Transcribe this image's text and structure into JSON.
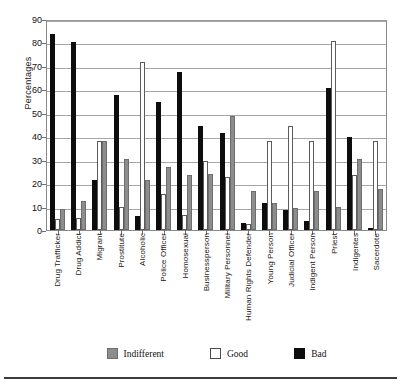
{
  "chart_data": {
    "type": "bar",
    "title": "",
    "xlabel": "",
    "ylabel": "Percentages",
    "ylim": [
      0,
      90
    ],
    "yticks": [
      0,
      10,
      20,
      30,
      40,
      50,
      60,
      70,
      80,
      90
    ],
    "grid": true,
    "legend_position": "bottom",
    "categories": [
      "Drug Trafficker",
      "Drug Addict",
      "Migrant",
      "Prostitute",
      "Alcoholic",
      "Police Officer",
      "Homosexual",
      "Businessperson",
      "Military Personnel",
      "Human Rights Defender",
      "Young Person",
      "Judicial Officer",
      "Indigent Person",
      "Priest",
      "Indigentes",
      "Sacerdote"
    ],
    "series": [
      {
        "name": "Bad",
        "color": "#0d0d0d",
        "values": [
          83.5,
          80.0,
          21.5,
          57.5,
          6.0,
          54.5,
          67.5,
          44.5,
          41.5,
          3.0,
          11.5,
          8.5,
          4.0,
          60.5,
          39.5,
          0.0
        ]
      },
      {
        "name": "Good",
        "color": "#ffffff",
        "values": [
          4.5,
          5.0,
          38.0,
          10.0,
          71.5,
          15.5,
          6.5,
          29.5,
          22.5,
          2.5,
          38.0,
          44.5,
          38.0,
          80.5,
          23.5,
          38.0
        ]
      },
      {
        "name": "Indifferent",
        "color": "#8d8d8d",
        "values": [
          9.0,
          12.5,
          38.0,
          30.5,
          21.5,
          27.0,
          23.5,
          24.0,
          48.5,
          16.5,
          11.5,
          9.5,
          16.5,
          10.0,
          30.5,
          17.5
        ]
      }
    ]
  },
  "legend": {
    "items": [
      {
        "label": "Indifferent",
        "swatch": "indifferent"
      },
      {
        "label": "Good",
        "swatch": "good"
      },
      {
        "label": "Bad",
        "swatch": "bad"
      }
    ]
  },
  "axis": {
    "y_title": "Percentages"
  }
}
